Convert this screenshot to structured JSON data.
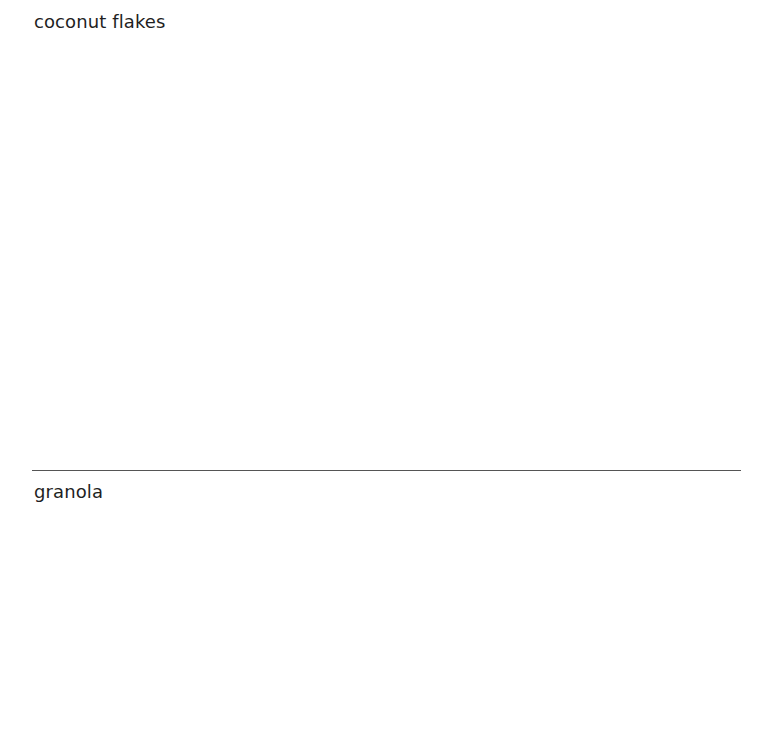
{
  "sections": [
    {
      "title": "coconut flakes"
    },
    {
      "title": "granola"
    }
  ]
}
